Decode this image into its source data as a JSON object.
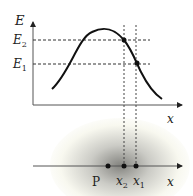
{
  "diagram": {
    "top_plot": {
      "y_axis_label": "E",
      "x_axis_label": "x",
      "levels": [
        {
          "name": "E",
          "sub": "2"
        },
        {
          "name": "E",
          "sub": "1"
        }
      ]
    },
    "bottom_axis": {
      "x_axis_label": "x",
      "points": [
        {
          "name": "P",
          "sub": ""
        },
        {
          "name": "x",
          "sub": "2"
        },
        {
          "name": "x",
          "sub": "1"
        }
      ]
    }
  }
}
